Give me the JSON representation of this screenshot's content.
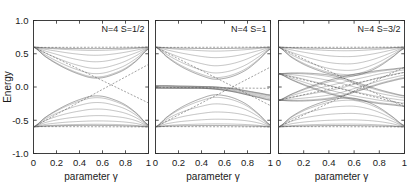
{
  "figure": {
    "ylabel": "Energy",
    "xlabel": "parameter γ",
    "y_ticks": [
      "1.0",
      "0.5",
      "0.0",
      "-0.5",
      "-1.0"
    ],
    "y_tick_values": [
      1.0,
      0.5,
      0.0,
      -0.5,
      -1.0
    ],
    "x_ticks": [
      "0",
      "0.2",
      "0.4",
      "0.6",
      "0.8",
      "1"
    ],
    "x_tick_values": [
      0,
      0.2,
      0.4,
      0.6,
      0.8,
      1
    ],
    "panels": [
      {
        "label": "N=4 S=1/2"
      },
      {
        "label": "N=4 S=1"
      },
      {
        "label": "N=4 S=3/2"
      }
    ],
    "colors": {
      "axis": "#2b2b2b",
      "curve": "#3a3a3a",
      "curve_faint": "#6b6b6b",
      "dashed": "#555555",
      "background": "#ffffff",
      "text": "#1a1a1a"
    }
  },
  "chart_data": {
    "type": "line",
    "title": "",
    "xlabel": "parameter γ",
    "ylabel": "Energy",
    "xlim": [
      0,
      1
    ],
    "ylim": [
      -1.0,
      1.0
    ],
    "grid": false,
    "legend": "none",
    "panel_count": 3,
    "shared_x": [
      0,
      0.1,
      0.2,
      0.3,
      0.4,
      0.5,
      0.6,
      0.7,
      0.8,
      0.9,
      1.0
    ],
    "panels": [
      {
        "label": "N=4 S=1/2",
        "band_origins": [
          0.6,
          -0.6
        ],
        "description": "Two lens-shaped band manifolds emanating from E=+0.6 and E=-0.6 at gamma=0, narrowing back toward the same edges at gamma=1; a pair of straight dashed guide lines cross near (0.5, 0.0).",
        "envelopes": [
          {
            "name": "upper-band-top",
            "values": [
              0.6,
              0.59,
              0.585,
              0.58,
              0.578,
              0.577,
              0.578,
              0.58,
              0.585,
              0.59,
              0.6
            ]
          },
          {
            "name": "upper-band-bottom",
            "values": [
              0.6,
              0.46,
              0.35,
              0.26,
              0.19,
              0.14,
              0.14,
              0.19,
              0.27,
              0.4,
              0.57
            ]
          },
          {
            "name": "lower-band-top",
            "values": [
              -0.6,
              -0.46,
              -0.35,
              -0.26,
              -0.19,
              -0.14,
              -0.14,
              -0.19,
              -0.27,
              -0.4,
              -0.57
            ]
          },
          {
            "name": "lower-band-bottom",
            "values": [
              -0.6,
              -0.59,
              -0.585,
              -0.58,
              -0.578,
              -0.577,
              -0.578,
              -0.58,
              -0.585,
              -0.59,
              -0.6
            ]
          }
        ],
        "dashed_lines": [
          {
            "name": "dashed-rising",
            "from": [
              0.0,
              -0.6
            ],
            "to": [
              1.0,
              0.34
            ]
          },
          {
            "name": "dashed-falling",
            "from": [
              0.0,
              0.6
            ],
            "to": [
              1.0,
              -0.24
            ]
          },
          {
            "name": "dashed-top-flat",
            "from": [
              0.0,
              0.595
            ],
            "to": [
              1.0,
              0.6
            ]
          },
          {
            "name": "dashed-bottom-flat",
            "from": [
              0.0,
              -0.595
            ],
            "to": [
              1.0,
              -0.6
            ]
          }
        ],
        "curve_count": 14
      },
      {
        "label": "N=4 S=1",
        "band_origins": [
          0.6,
          0.0,
          -0.6
        ],
        "description": "Same two outer lens manifolds as S=1/2 plus an extra near-flat band hugging E=0 that splits slightly and tilts downward past gamma=0.5; dashed guide lines cross near (0.55, -0.02).",
        "envelopes": [
          {
            "name": "upper-band-top",
            "values": [
              0.6,
              0.59,
              0.585,
              0.582,
              0.579,
              0.578,
              0.579,
              0.582,
              0.586,
              0.591,
              0.6
            ]
          },
          {
            "name": "upper-band-bottom",
            "values": [
              0.6,
              0.45,
              0.33,
              0.24,
              0.17,
              0.12,
              0.13,
              0.18,
              0.27,
              0.41,
              0.57
            ]
          },
          {
            "name": "mid-band-top",
            "values": [
              0.02,
              0.02,
              0.015,
              0.012,
              0.008,
              0.004,
              -0.01,
              -0.03,
              -0.06,
              -0.09,
              -0.12
            ]
          },
          {
            "name": "mid-band-bottom",
            "values": [
              -0.02,
              -0.02,
              -0.02,
              -0.02,
              -0.02,
              -0.03,
              -0.05,
              -0.08,
              -0.12,
              -0.16,
              -0.2
            ]
          },
          {
            "name": "lower-band-top",
            "values": [
              -0.6,
              -0.45,
              -0.33,
              -0.24,
              -0.17,
              -0.12,
              -0.13,
              -0.18,
              -0.27,
              -0.41,
              -0.57
            ]
          },
          {
            "name": "lower-band-bottom",
            "values": [
              -0.6,
              -0.59,
              -0.585,
              -0.582,
              -0.579,
              -0.578,
              -0.579,
              -0.582,
              -0.586,
              -0.591,
              -0.6
            ]
          }
        ],
        "dashed_lines": [
          {
            "name": "dashed-rising",
            "from": [
              0.0,
              -0.6
            ],
            "to": [
              1.0,
              0.3
            ]
          },
          {
            "name": "dashed-falling",
            "from": [
              0.0,
              0.6
            ],
            "to": [
              1.0,
              -0.28
            ]
          },
          {
            "name": "dashed-mid-flat",
            "from": [
              0.0,
              -0.005
            ],
            "to": [
              1.0,
              -0.02
            ]
          },
          {
            "name": "dashed-top-flat",
            "from": [
              0.0,
              0.595
            ],
            "to": [
              1.0,
              0.6
            ]
          },
          {
            "name": "dashed-bottom-flat",
            "from": [
              0.0,
              -0.595
            ],
            "to": [
              1.0,
              -0.6
            ]
          }
        ],
        "curve_count": 16
      },
      {
        "label": "N=4 S=3/2",
        "band_origins": [
          0.6,
          0.2,
          -0.2,
          -0.6
        ],
        "description": "Four band manifolds starting at E=+0.6, +0.2, -0.2 and -0.6 at gamma=0; the two inner manifolds cross each other in a dense braided region around gamma=0.4-0.6, while several dashed guide lines sweep across the full panel.",
        "envelopes": [
          {
            "name": "band1-top",
            "values": [
              0.6,
              0.592,
              0.587,
              0.583,
              0.58,
              0.579,
              0.58,
              0.583,
              0.587,
              0.592,
              0.6
            ]
          },
          {
            "name": "band1-bottom",
            "values": [
              0.6,
              0.45,
              0.34,
              0.26,
              0.2,
              0.17,
              0.17,
              0.22,
              0.31,
              0.44,
              0.58
            ]
          },
          {
            "name": "band2-top",
            "values": [
              0.2,
              0.21,
              0.21,
              0.2,
              0.18,
              0.14,
              0.08,
              0.02,
              -0.04,
              -0.09,
              -0.13
            ]
          },
          {
            "name": "band2-bottom",
            "values": [
              0.2,
              0.11,
              0.03,
              -0.04,
              -0.1,
              -0.15,
              -0.19,
              -0.22,
              -0.25,
              -0.27,
              -0.29
            ]
          },
          {
            "name": "band3-top",
            "values": [
              -0.2,
              -0.11,
              -0.03,
              0.04,
              0.1,
              0.15,
              0.19,
              0.22,
              0.25,
              0.27,
              0.29
            ]
          },
          {
            "name": "band3-bottom",
            "values": [
              -0.2,
              -0.21,
              -0.21,
              -0.2,
              -0.18,
              -0.14,
              -0.08,
              -0.02,
              0.04,
              0.09,
              0.13
            ]
          },
          {
            "name": "band4-top",
            "values": [
              -0.6,
              -0.45,
              -0.34,
              -0.26,
              -0.2,
              -0.17,
              -0.17,
              -0.22,
              -0.31,
              -0.44,
              -0.58
            ]
          },
          {
            "name": "band4-bottom",
            "values": [
              -0.6,
              -0.592,
              -0.587,
              -0.583,
              -0.58,
              -0.579,
              -0.58,
              -0.583,
              -0.587,
              -0.592,
              -0.6
            ]
          }
        ],
        "dashed_lines": [
          {
            "name": "dashed-rising-outer",
            "from": [
              0.0,
              -0.6
            ],
            "to": [
              1.0,
              0.3
            ]
          },
          {
            "name": "dashed-falling-outer",
            "from": [
              0.0,
              0.6
            ],
            "to": [
              1.0,
              -0.3
            ]
          },
          {
            "name": "dashed-rising-inner",
            "from": [
              0.0,
              -0.2
            ],
            "to": [
              1.0,
              0.22
            ]
          },
          {
            "name": "dashed-falling-inner",
            "from": [
              0.0,
              0.2
            ],
            "to": [
              1.0,
              -0.26
            ]
          },
          {
            "name": "dashed-top-flat",
            "from": [
              0.0,
              0.595
            ],
            "to": [
              1.0,
              0.6
            ]
          },
          {
            "name": "dashed-bottom-flat",
            "from": [
              0.0,
              -0.595
            ],
            "to": [
              1.0,
              -0.6
            ]
          }
        ],
        "curve_count": 20
      }
    ]
  }
}
